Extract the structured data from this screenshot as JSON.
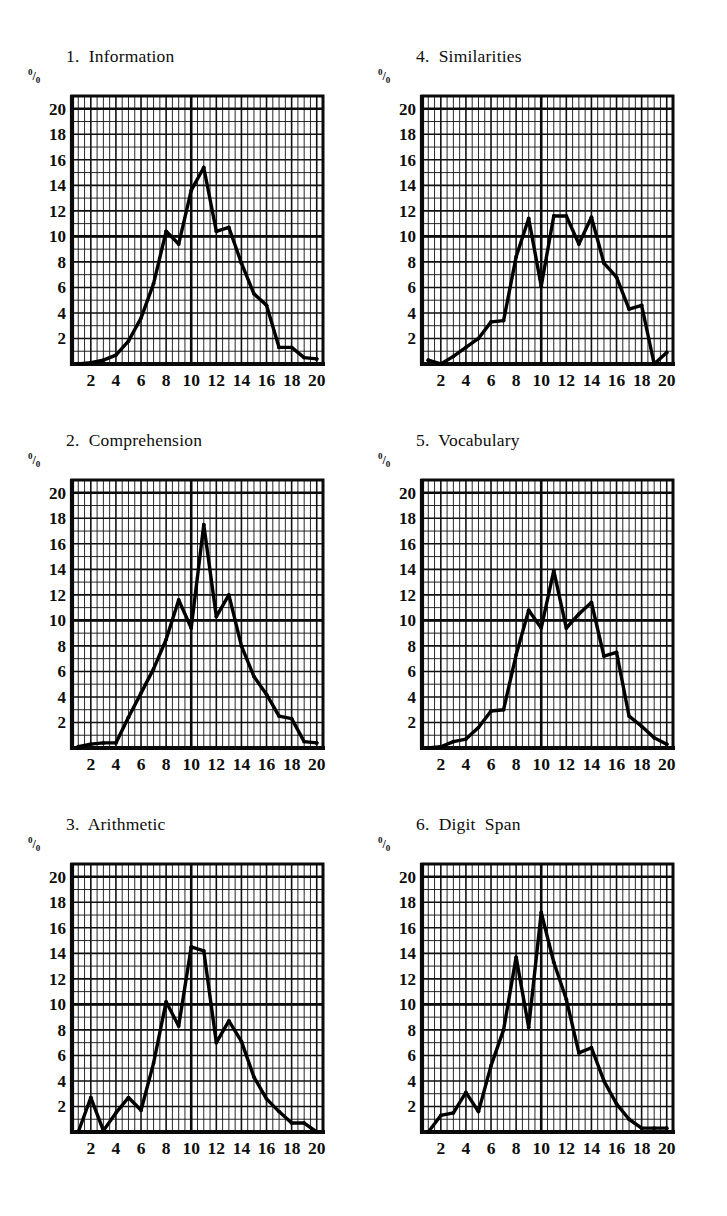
{
  "page": {
    "background": "#ffffff",
    "ink": "#0d0d0d",
    "percent_symbol_top": "0",
    "percent_symbol_slash": "/",
    "percent_symbol_bottom": "0"
  },
  "axis": {
    "y_ticks": [
      2,
      4,
      6,
      8,
      10,
      12,
      14,
      16,
      18,
      20
    ],
    "x_ticks": [
      2,
      4,
      6,
      8,
      10,
      12,
      14,
      16,
      18,
      20
    ],
    "y_label": "%",
    "ylim": [
      0,
      21
    ],
    "xlim": [
      0.5,
      20.5
    ],
    "minor_step": 1,
    "major_step": 2,
    "grid": true
  },
  "chart_data": [
    {
      "type": "line",
      "id": "information",
      "number": "1.",
      "title": "1.  Information",
      "name": "Information",
      "xlabel": "",
      "ylabel": "%",
      "ylim": [
        0,
        21
      ],
      "xlim": [
        0.5,
        20.5
      ],
      "grid": true,
      "legend": "none",
      "x": [
        1,
        2,
        3,
        4,
        5,
        6,
        7,
        8,
        9,
        10,
        11,
        12,
        13,
        14,
        15,
        16,
        17,
        18,
        19,
        20
      ],
      "values": [
        0.0,
        0.1,
        0.3,
        0.7,
        1.8,
        3.6,
        6.3,
        10.4,
        9.4,
        13.6,
        15.4,
        10.4,
        10.7,
        7.9,
        5.5,
        4.6,
        1.3,
        1.3,
        0.5,
        0.4
      ]
    },
    {
      "type": "line",
      "id": "comprehension",
      "number": "2.",
      "title": "2.  Comprehension",
      "name": "Comprehension",
      "xlabel": "",
      "ylabel": "%",
      "ylim": [
        0,
        21
      ],
      "xlim": [
        0.5,
        20.5
      ],
      "grid": true,
      "legend": "none",
      "x": [
        1,
        2,
        3,
        4,
        5,
        6,
        7,
        8,
        9,
        10,
        11,
        12,
        13,
        14,
        15,
        16,
        17,
        18,
        19,
        20
      ],
      "values": [
        0.1,
        0.3,
        0.4,
        0.4,
        2.4,
        4.3,
        6.2,
        8.5,
        11.6,
        9.4,
        17.5,
        10.3,
        12.0,
        8.0,
        5.6,
        4.2,
        2.5,
        2.3,
        0.5,
        0.4
      ]
    },
    {
      "type": "line",
      "id": "arithmetic",
      "number": "3.",
      "title": "3.  Arithmetic",
      "name": "Arithmetic",
      "xlabel": "",
      "ylabel": "%",
      "ylim": [
        0,
        21
      ],
      "xlim": [
        0.5,
        20.5
      ],
      "grid": true,
      "legend": "none",
      "x": [
        1,
        2,
        3,
        4,
        5,
        6,
        7,
        8,
        9,
        10,
        11,
        12,
        13,
        14,
        15,
        16,
        17,
        18,
        19,
        20
      ],
      "values": [
        0.0,
        2.7,
        0.1,
        1.5,
        2.7,
        1.7,
        5.4,
        10.2,
        8.3,
        14.5,
        14.2,
        7.0,
        8.7,
        7.1,
        4.3,
        2.6,
        1.6,
        0.7,
        0.7,
        0.0
      ]
    },
    {
      "type": "line",
      "id": "similarities",
      "number": "4.",
      "title": "4.  Similarities",
      "name": "Similarities",
      "xlabel": "",
      "ylabel": "%",
      "ylim": [
        0,
        21
      ],
      "xlim": [
        0.5,
        20.5
      ],
      "grid": true,
      "legend": "none",
      "x": [
        1,
        2,
        3,
        4,
        5,
        6,
        7,
        8,
        9,
        10,
        11,
        12,
        13,
        14,
        15,
        16,
        17,
        18,
        19,
        20
      ],
      "values": [
        0.3,
        0.0,
        0.6,
        1.3,
        2.0,
        3.3,
        3.4,
        8.4,
        11.4,
        6.1,
        11.6,
        11.6,
        9.4,
        11.5,
        7.9,
        6.8,
        4.3,
        4.6,
        0.0,
        0.9
      ]
    },
    {
      "type": "line",
      "id": "vocabulary",
      "number": "5.",
      "title": "5.  Vocabulary",
      "name": "Vocabulary",
      "xlabel": "",
      "ylabel": "%",
      "ylim": [
        0,
        21
      ],
      "xlim": [
        0.5,
        20.5
      ],
      "grid": true,
      "legend": "none",
      "x": [
        1,
        2,
        3,
        4,
        5,
        6,
        7,
        8,
        9,
        10,
        11,
        12,
        13,
        14,
        15,
        16,
        17,
        18,
        19,
        20
      ],
      "values": [
        0.0,
        0.1,
        0.5,
        0.7,
        1.6,
        2.9,
        3.0,
        7.3,
        10.8,
        9.4,
        13.9,
        9.4,
        10.5,
        11.4,
        7.2,
        7.5,
        2.5,
        1.7,
        0.8,
        0.3
      ]
    },
    {
      "type": "line",
      "id": "digit-span",
      "number": "6.",
      "title": "6.  Digit  Span",
      "name": "Digit Span",
      "xlabel": "",
      "ylabel": "%",
      "ylim": [
        0,
        21
      ],
      "xlim": [
        0.5,
        20.5
      ],
      "grid": true,
      "legend": "none",
      "x": [
        1,
        2,
        3,
        4,
        5,
        6,
        7,
        8,
        9,
        10,
        11,
        12,
        13,
        14,
        15,
        16,
        17,
        18,
        19,
        20
      ],
      "values": [
        0.0,
        1.3,
        1.5,
        3.1,
        1.6,
        5.2,
        8.0,
        13.7,
        8.2,
        17.2,
        13.3,
        10.4,
        6.2,
        6.6,
        4.0,
        2.2,
        1.0,
        0.3,
        0.3,
        0.3
      ]
    }
  ]
}
